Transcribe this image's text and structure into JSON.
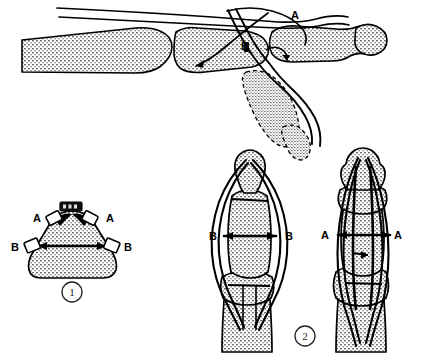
{
  "figure": {
    "background_color": "#ffffff",
    "ink_color": "#000000",
    "bone_fill_color": "#b9b9b9",
    "stipple_dot_color": "#6e6e6e",
    "panels": [
      {
        "id": "lateral-view",
        "caption": "",
        "description": "Lateral view of finger with suture strands passing over phalanges; distal phalanx shown flexed in dashed outline",
        "labels": [
          {
            "text": "A",
            "x": 291,
            "y": 19
          },
          {
            "text": "B",
            "x": 247,
            "y": 47
          }
        ]
      },
      {
        "id": "cross-section",
        "caption": "1",
        "description": "Cross-section of finger showing suture placement points A (dorsolateral) and B (midlateral)",
        "labels": [
          {
            "text": "A",
            "x": 37,
            "y": 222
          },
          {
            "text": "A",
            "x": 111,
            "y": 222
          },
          {
            "text": "B",
            "x": 16,
            "y": 250
          },
          {
            "text": "B",
            "x": 127,
            "y": 250
          }
        ],
        "number_label": "1"
      },
      {
        "id": "dorsal-views",
        "caption": "2",
        "description": "Two dorsal views of finger showing suture loops; left marked B-B, right marked A-A",
        "labels": [
          {
            "text": "B",
            "x": 214,
            "y": 238
          },
          {
            "text": "B",
            "x": 288,
            "y": 238
          },
          {
            "text": "A",
            "x": 325,
            "y": 237
          },
          {
            "text": "A",
            "x": 395,
            "y": 237
          }
        ],
        "number_label": "2"
      }
    ]
  },
  "label_glyphs": {
    "A": "A",
    "B": "B",
    "one": "1",
    "two": "2"
  }
}
